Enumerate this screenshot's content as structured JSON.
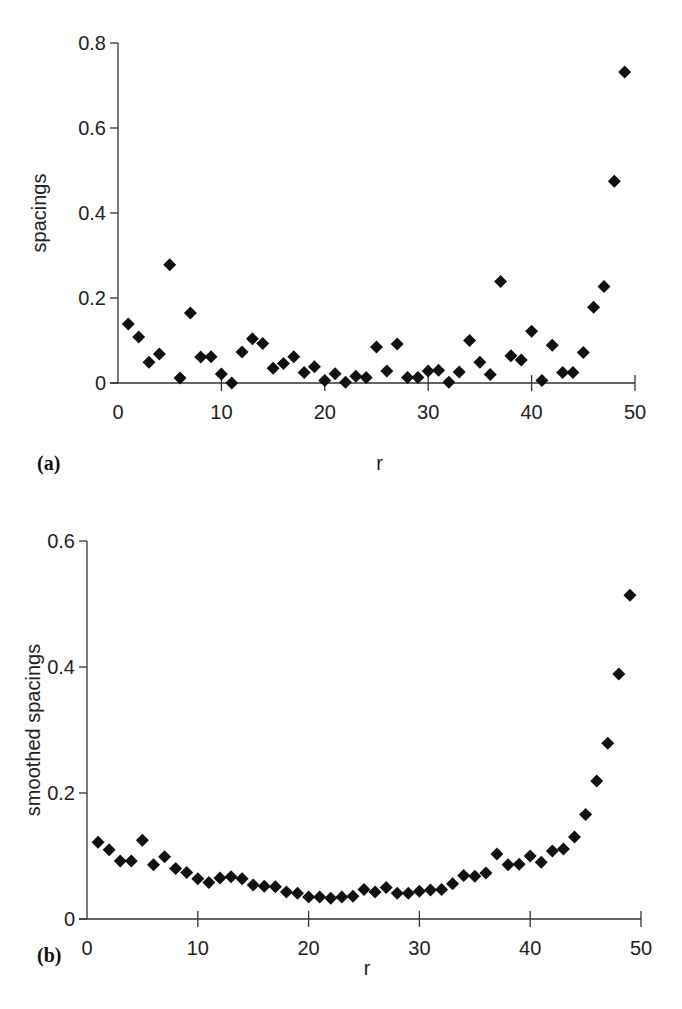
{
  "figure": {
    "background": "#ffffff",
    "marker_color": "#111111",
    "axis_color": "#333333"
  },
  "chart_data": [
    {
      "type": "scatter",
      "panel_label": "(a)",
      "title": "",
      "xlabel": "r",
      "ylabel": "spacings",
      "xlim": [
        0,
        50
      ],
      "ylim": [
        0,
        0.8
      ],
      "xticks": [
        0,
        10,
        20,
        30,
        40,
        50
      ],
      "xtick_labels": [
        "0",
        "10",
        "20",
        "30",
        "40",
        "50"
      ],
      "yticks": [
        0,
        0.2,
        0.4,
        0.6,
        0.8
      ],
      "ytick_labels": [
        "0",
        "0.2",
        "0.4",
        "0.6",
        "0.8"
      ],
      "grid": false,
      "legend": null,
      "marker": "diamond",
      "x": [
        1,
        2,
        3,
        4,
        5,
        6,
        7,
        8,
        9,
        10,
        11,
        12,
        13,
        14,
        15,
        16,
        17,
        18,
        19,
        20,
        21,
        22,
        23,
        24,
        25,
        26,
        27,
        28,
        29,
        30,
        31,
        32,
        33,
        34,
        35,
        36,
        37,
        38,
        39,
        40,
        41,
        42,
        43,
        44,
        45,
        46,
        47,
        48,
        49
      ],
      "y": [
        0.139,
        0.108,
        0.049,
        0.068,
        0.278,
        0.012,
        0.165,
        0.061,
        0.062,
        0.021,
        0.0,
        0.073,
        0.104,
        0.093,
        0.035,
        0.046,
        0.062,
        0.025,
        0.038,
        0.006,
        0.022,
        0.002,
        0.016,
        0.013,
        0.085,
        0.028,
        0.092,
        0.013,
        0.013,
        0.028,
        0.03,
        0.002,
        0.026,
        0.1,
        0.049,
        0.02,
        0.239,
        0.064,
        0.054,
        0.122,
        0.006,
        0.089,
        0.025,
        0.025,
        0.072,
        0.178,
        0.227,
        0.475,
        0.732
      ],
      "layout": {
        "x0": 118,
        "x1": 635,
        "y0": 383,
        "y1": 43,
        "xlabel_y": 470,
        "panel_label_x": 37,
        "panel_label_y": 470,
        "ylabel_x": 46
      }
    },
    {
      "type": "scatter",
      "panel_label": "(b)",
      "title": "",
      "xlabel": "r",
      "ylabel": "smoothed spacings",
      "xlim": [
        0,
        50
      ],
      "ylim": [
        0,
        0.6
      ],
      "xticks": [
        0,
        10,
        20,
        30,
        40,
        50
      ],
      "xtick_labels": [
        "0",
        "10",
        "20",
        "30",
        "40",
        "50"
      ],
      "yticks": [
        0,
        0.2,
        0.4,
        0.6
      ],
      "ytick_labels": [
        "0",
        "0.2",
        "0.4",
        "0.6"
      ],
      "grid": false,
      "legend": null,
      "marker": "diamond",
      "x": [
        1,
        2,
        3,
        4,
        5,
        6,
        7,
        8,
        9,
        10,
        11,
        12,
        13,
        14,
        15,
        16,
        17,
        18,
        19,
        20,
        21,
        22,
        23,
        24,
        25,
        26,
        27,
        28,
        29,
        30,
        31,
        32,
        33,
        34,
        35,
        36,
        37,
        38,
        39,
        40,
        41,
        42,
        43,
        44,
        45,
        46,
        47,
        48,
        49
      ],
      "y": [
        0.122,
        0.11,
        0.092,
        0.092,
        0.125,
        0.086,
        0.099,
        0.08,
        0.074,
        0.064,
        0.058,
        0.065,
        0.067,
        0.064,
        0.054,
        0.052,
        0.051,
        0.043,
        0.041,
        0.035,
        0.035,
        0.033,
        0.035,
        0.036,
        0.047,
        0.043,
        0.05,
        0.041,
        0.041,
        0.044,
        0.046,
        0.047,
        0.056,
        0.069,
        0.068,
        0.073,
        0.103,
        0.086,
        0.087,
        0.1,
        0.09,
        0.108,
        0.111,
        0.13,
        0.166,
        0.219,
        0.279,
        0.389,
        0.514
      ],
      "layout": {
        "x0": 87,
        "x1": 641,
        "y0": 919,
        "y1": 541,
        "xlabel_y": 975,
        "panel_label_x": 37,
        "panel_label_y": 962,
        "ylabel_x": 40
      }
    }
  ]
}
